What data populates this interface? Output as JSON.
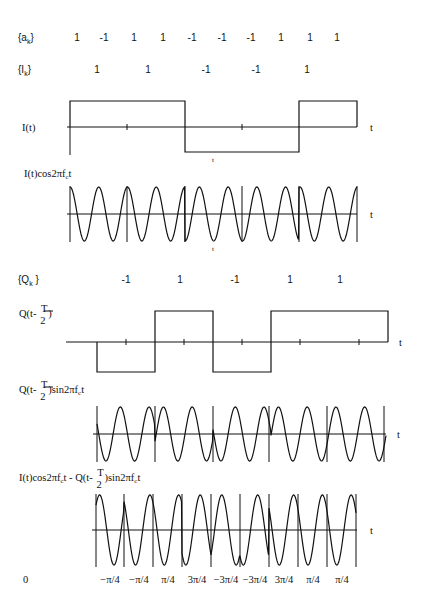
{
  "sequences": {
    "a_k": {
      "label": "{a",
      "sub": "k",
      "close": "}",
      "values": [
        "1",
        "-1",
        "1",
        "1",
        "-1",
        "-1",
        "-1",
        "1",
        "1",
        "1"
      ],
      "x": [
        77,
        104,
        134,
        163,
        192,
        222,
        251,
        281,
        310,
        337
      ]
    },
    "I_k": {
      "label": "{I",
      "sub": "k",
      "close": "}",
      "values": [
        "1",
        "1",
        "-1",
        "-1",
        "1"
      ],
      "x": [
        97,
        148,
        206,
        256,
        307
      ]
    },
    "Q_k": {
      "label": "{Q",
      "sub": "k",
      "close": " }",
      "values": [
        "-1",
        "1",
        "-1",
        "1",
        "1"
      ],
      "x": [
        126,
        180,
        235,
        290,
        340
      ]
    }
  },
  "plots": {
    "I": {
      "label": "I(t)",
      "axis_label": "t",
      "below_label": "t"
    },
    "I_cos": {
      "label_pre": "I(t)cos2πf",
      "label_sub": "c",
      "label_post": "t",
      "axis_label": "t",
      "below_label": "t"
    },
    "Q": {
      "label_pre": "Q(t- ",
      "frac_num": "T",
      "frac_den": "2",
      "label_post": " )",
      "axis_label": "t"
    },
    "Q_sin": {
      "label_pre": "Q(t- ",
      "frac_num": "T",
      "frac_den": "2",
      "label_post": " )sin2πf",
      "label_sub": "c",
      "label_end": "t",
      "axis_label": "t"
    },
    "sum": {
      "label_pre": "I(t)cos2πf",
      "label_sub1": "c",
      "label_mid": "t - Q(t- ",
      "frac_num": "T",
      "frac_den": "2",
      "label_post": " )sin2πf",
      "label_sub2": "c",
      "label_end": "t",
      "axis_label": "t"
    }
  },
  "phase_labels": {
    "origin": "0",
    "values": [
      "−π/4",
      "−π/4",
      "π/4",
      "3π/4",
      "−3π/4",
      "−3π/4",
      "3π/4",
      "π/4",
      "π/4"
    ],
    "x": [
      110,
      139,
      168,
      197,
      226,
      255,
      284,
      313,
      342
    ]
  },
  "chart_data": {
    "type": "line",
    "a_k": [
      1,
      -1,
      1,
      1,
      -1,
      -1,
      -1,
      1,
      1,
      1
    ],
    "I_k": [
      1,
      1,
      -1,
      -1,
      1
    ],
    "Q_k": [
      -1,
      1,
      -1,
      1,
      1
    ],
    "phases": [
      "-π/4",
      "-π/4",
      "π/4",
      "3π/4",
      "-3π/4",
      "-3π/4",
      "3π/4",
      "π/4",
      "π/4"
    ],
    "series": [
      {
        "name": "I(t)",
        "levels": [
          1,
          1,
          -1,
          -1,
          1
        ]
      },
      {
        "name": "I(t)cos2πf_c t"
      },
      {
        "name": "Q(t-T/2)",
        "levels": [
          -1,
          1,
          -1,
          1,
          1
        ]
      },
      {
        "name": "Q(t-T/2)sin2πf_c t"
      },
      {
        "name": "I(t)cos2πf_c t - Q(t-T/2)sin2πf_c t"
      }
    ],
    "xlabel": "t"
  }
}
